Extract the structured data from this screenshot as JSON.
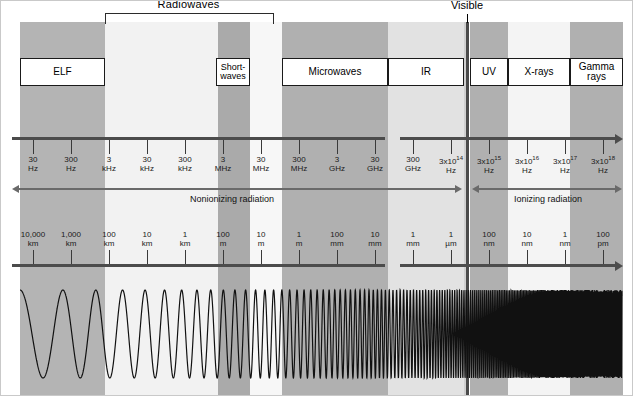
{
  "figure": {
    "width": 633,
    "height": 396
  },
  "bracket": {
    "label": "Radiowaves",
    "start_px": 105,
    "end_px": 272
  },
  "visible": {
    "label": "Visible",
    "x_px": 467
  },
  "bands": [
    {
      "name": "band-elf",
      "x": 20,
      "w": 85,
      "color": "#b4b4b4"
    },
    {
      "name": "band-radio-lf",
      "x": 105,
      "w": 113,
      "color": "#f2f2f2"
    },
    {
      "name": "band-shortwaves",
      "x": 218,
      "w": 32,
      "color": "#aaaaaa"
    },
    {
      "name": "band-radio-hf",
      "x": 250,
      "w": 32,
      "color": "#f7f7f7"
    },
    {
      "name": "band-microwave",
      "x": 282,
      "w": 106,
      "color": "#b0b0b0"
    },
    {
      "name": "band-ir",
      "x": 388,
      "w": 76,
      "color": "#e2e2e2"
    },
    {
      "name": "band-visible-l",
      "x": 464,
      "w": 3,
      "color": "#cfcfcf"
    },
    {
      "name": "band-uv",
      "x": 470,
      "w": 38,
      "color": "#b0b0b0"
    },
    {
      "name": "band-xray",
      "x": 508,
      "w": 62,
      "color": "#f4f4f4"
    },
    {
      "name": "band-gamma",
      "x": 570,
      "w": 53,
      "color": "#b0b0b0"
    }
  ],
  "name_boxes": [
    {
      "name": "label-box-elf",
      "label": "ELF",
      "x": 20,
      "w": 85,
      "lines": 1
    },
    {
      "name": "label-box-shortwaves",
      "label": "Short-\nwaves",
      "x": 216,
      "w": 34,
      "lines": 2
    },
    {
      "name": "label-box-microwaves",
      "label": "Microwaves",
      "x": 282,
      "w": 106,
      "lines": 1
    },
    {
      "name": "label-box-ir",
      "label": "IR",
      "x": 388,
      "w": 76,
      "lines": 1
    },
    {
      "name": "label-box-uv",
      "label": "UV",
      "x": 470,
      "w": 38,
      "lines": 1
    },
    {
      "name": "label-box-xrays",
      "label": "X-rays",
      "x": 508,
      "w": 62,
      "lines": 1
    },
    {
      "name": "label-box-gamma",
      "label": "Gamma rays",
      "x": 570,
      "w": 53,
      "lines": 1
    }
  ],
  "frequency_axis": {
    "name": "frequency-axis",
    "y_px": 137,
    "start_px": 12,
    "end_px": 622,
    "gap_start_px": 385,
    "gap_end_px": 400,
    "ticks": [
      {
        "x": 33,
        "value": "30",
        "unit": "Hz"
      },
      {
        "x": 71,
        "value": "300",
        "unit": "Hz"
      },
      {
        "x": 109,
        "value": "3",
        "unit": "kHz"
      },
      {
        "x": 147,
        "value": "30",
        "unit": "kHz"
      },
      {
        "x": 185,
        "value": "300",
        "unit": "kHz"
      },
      {
        "x": 223,
        "value": "3",
        "unit": "MHz"
      },
      {
        "x": 261,
        "value": "30",
        "unit": "MHz"
      },
      {
        "x": 299,
        "value": "300",
        "unit": "MHz"
      },
      {
        "x": 337,
        "value": "3",
        "unit": "GHz"
      },
      {
        "x": 375,
        "value": "30",
        "unit": "GHz"
      },
      {
        "x": 413,
        "value": "300",
        "unit": "GHz"
      },
      {
        "x": 451,
        "value": "3x10^14",
        "unit": "Hz"
      },
      {
        "x": 489,
        "value": "3x10^15",
        "unit": "Hz"
      },
      {
        "x": 527,
        "value": "3x10^16",
        "unit": "Hz"
      },
      {
        "x": 565,
        "value": "3x10^17",
        "unit": "Hz"
      },
      {
        "x": 603,
        "value": "3x10^18",
        "unit": "Hz"
      }
    ]
  },
  "wavelength_axis": {
    "name": "wavelength-axis",
    "y_px": 264,
    "start_px": 12,
    "end_px": 622,
    "gap_start_px": 385,
    "gap_end_px": 400,
    "ticks": [
      {
        "x": 33,
        "value": "10,000",
        "unit": "km"
      },
      {
        "x": 71,
        "value": "1,000",
        "unit": "km"
      },
      {
        "x": 109,
        "value": "100",
        "unit": "km"
      },
      {
        "x": 147,
        "value": "10",
        "unit": "km"
      },
      {
        "x": 185,
        "value": "1",
        "unit": "km"
      },
      {
        "x": 223,
        "value": "100",
        "unit": "m"
      },
      {
        "x": 261,
        "value": "10",
        "unit": "m"
      },
      {
        "x": 299,
        "value": "1",
        "unit": "m"
      },
      {
        "x": 337,
        "value": "100",
        "unit": "mm"
      },
      {
        "x": 375,
        "value": "10",
        "unit": "mm"
      },
      {
        "x": 413,
        "value": "1",
        "unit": "mm"
      },
      {
        "x": 451,
        "value": "1",
        "unit": "µm"
      },
      {
        "x": 489,
        "value": "100",
        "unit": "nm"
      },
      {
        "x": 527,
        "value": "10",
        "unit": "nm"
      },
      {
        "x": 565,
        "value": "1",
        "unit": "nm"
      },
      {
        "x": 603,
        "value": "100",
        "unit": "pm"
      }
    ]
  },
  "radiation_ranges": [
    {
      "name": "nonionizing-radiation-range",
      "label": "Nonionizing radiation",
      "start_px": 12,
      "end_px": 462,
      "label_x": 232,
      "y_px": 188
    },
    {
      "name": "ionizing-radiation-range",
      "label": "Ionizing radiation",
      "start_px": 472,
      "end_px": 622,
      "label_x": 548,
      "y_px": 188
    }
  ],
  "wave": {
    "name": "chirp-waveform",
    "description": "sine wave of increasing frequency left to right",
    "stroke_color": "#111111",
    "start_px": 20,
    "end_px": 622,
    "baseline_y_px": 58,
    "amplitude_px": 44
  },
  "colors": {
    "band_dark": "#b0b0b0",
    "band_light": "#f4f4f4",
    "band_mid": "#e2e2e2",
    "axis": "#4c4c4c",
    "text": "#000000",
    "visible_marker": "#4a4a4a"
  }
}
